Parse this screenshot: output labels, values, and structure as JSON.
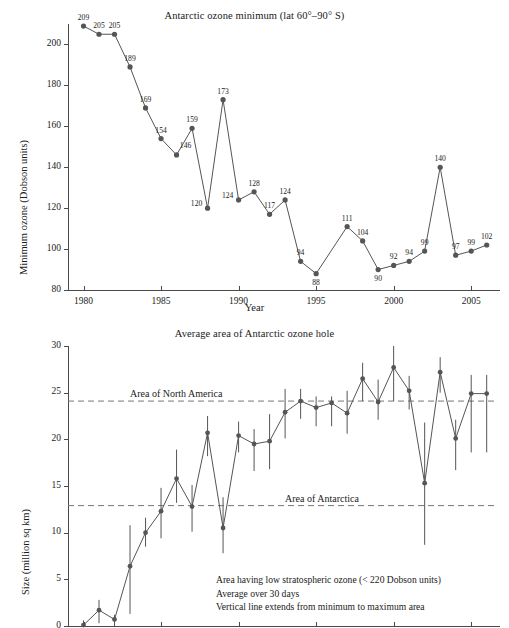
{
  "chart_data": [
    {
      "type": "line",
      "id": "antarctic-ozone-minimum",
      "title": "Antarctic ozone minimum (lat 60°–90° S)",
      "xlabel": "Year",
      "ylabel": "Minimum ozone (Dobson units)",
      "xlim": [
        1979.0,
        2006.6
      ],
      "ylim": [
        80,
        210
      ],
      "xticks": [
        1980,
        1985,
        1990,
        1995,
        2000,
        2005
      ],
      "xticklabels": [
        "1980",
        "1985",
        "1990",
        "1995",
        "2000",
        "2005"
      ],
      "yticks": [
        80,
        100,
        120,
        140,
        160,
        180,
        200
      ],
      "yticklabels": [
        "80",
        "100",
        "120",
        "140",
        "160",
        "180",
        "200"
      ],
      "grid": false,
      "legend": "none",
      "marker": "filled-circle",
      "series_color": "#555555",
      "point_labels_shown": true,
      "x": [
        1980,
        1981,
        1982,
        1983,
        1984,
        1985,
        1986,
        1987,
        1988,
        1989,
        1990,
        1991,
        1992,
        1993,
        1994,
        1995,
        1997,
        1998,
        1999,
        2000,
        2001,
        2002,
        2003,
        2004,
        2005,
        2006
      ],
      "values": [
        209,
        205,
        205,
        189,
        169,
        154,
        146,
        159,
        120,
        173,
        124,
        128,
        117,
        124,
        94,
        88,
        111,
        104,
        90,
        92,
        94,
        99,
        140,
        97,
        99,
        102
      ],
      "labels": [
        "209",
        "205",
        "205",
        "189",
        "169",
        "154",
        "146",
        "159",
        "120",
        "173",
        "124",
        "128",
        "117",
        "124",
        "94",
        "88",
        "111",
        "104",
        "90",
        "92",
        "94",
        "99",
        "140",
        "97",
        "99",
        "102"
      ],
      "label_side": [
        "above",
        "above",
        "above",
        "above",
        "above",
        "above",
        "right",
        "above",
        "left",
        "above",
        "left",
        "above",
        "above",
        "above",
        "above",
        "below",
        "above",
        "above",
        "below",
        "above",
        "above",
        "above",
        "above",
        "above",
        "above",
        "above"
      ]
    },
    {
      "type": "line",
      "id": "average-area-antarctic-ozone-hole",
      "title": "Average area of Antarctic ozone hole",
      "xlabel": "",
      "ylabel": "Size (million sq km)",
      "xlim": [
        1979.0,
        2006.6
      ],
      "ylim": [
        0,
        30
      ],
      "yticks": [
        0,
        5,
        10,
        15,
        20,
        25,
        30
      ],
      "yticklabels": [
        "0",
        "5",
        "10",
        "15",
        "20",
        "25",
        "30"
      ],
      "grid": false,
      "legend": "none",
      "marker": "filled-circle",
      "series_color": "#555555",
      "error_bars": "vertical line extends from minimum to maximum area",
      "x": [
        1980,
        1981,
        1982,
        1983,
        1984,
        1985,
        1986,
        1987,
        1988,
        1989,
        1990,
        1991,
        1992,
        1993,
        1994,
        1995,
        1996,
        1997,
        1998,
        1999,
        2000,
        2001,
        2002,
        2003,
        2004,
        2005,
        2006
      ],
      "values": [
        0.1,
        1.7,
        0.7,
        6.4,
        10.0,
        12.3,
        15.8,
        12.8,
        20.7,
        10.5,
        20.4,
        19.5,
        19.8,
        22.9,
        24.1,
        23.4,
        23.9,
        22.8,
        26.5,
        24.0,
        27.7,
        25.2,
        15.3,
        27.2,
        20.1,
        24.9,
        24.9
      ],
      "ymin": [
        0.0,
        0.3,
        0.0,
        1.3,
        8.5,
        9.4,
        13.2,
        10.1,
        18.2,
        7.8,
        18.6,
        16.6,
        16.8,
        20.1,
        22.2,
        21.4,
        21.4,
        20.6,
        24.1,
        22.1,
        24.1,
        23.2,
        8.7,
        25.0,
        16.7,
        18.6,
        18.6
      ],
      "ymax": [
        0.6,
        2.8,
        1.2,
        10.8,
        11.6,
        14.8,
        18.9,
        15.1,
        22.5,
        13.8,
        21.9,
        21.1,
        22.7,
        25.4,
        25.4,
        24.6,
        24.6,
        25.2,
        28.2,
        26.4,
        30.0,
        26.8,
        21.8,
        28.8,
        22.1,
        26.9,
        26.9
      ],
      "reference_lines": [
        {
          "label": "Area of North America",
          "value": 24.1
        },
        {
          "label": "Area of Antarctica",
          "value": 12.9
        }
      ],
      "annotations": [
        "Area having low stratospheric ozone (< 220 Dobson units)",
        "Average over 30 days",
        "Vertical line extends from minimum to maximum area"
      ]
    }
  ]
}
